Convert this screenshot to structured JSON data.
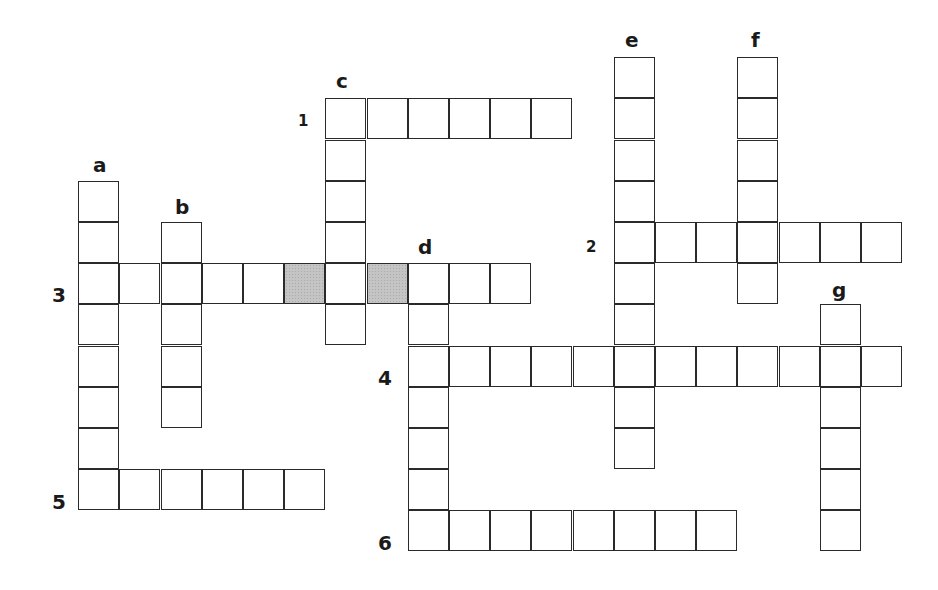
{
  "puzzle": {
    "type": "crossword",
    "cell_size": 41.2,
    "origin_x": 79,
    "origin_y": 58,
    "shade_color": "#c4c4c4",
    "across": [
      {
        "label": "1",
        "row": 1,
        "col": 6,
        "length": 6
      },
      {
        "label": "2",
        "row": 4,
        "col": 13,
        "length": 7
      },
      {
        "label": "3",
        "row": 5,
        "col": 0,
        "length": 11
      },
      {
        "label": "4",
        "row": 7,
        "col": 8,
        "length": 12
      },
      {
        "label": "5",
        "row": 10,
        "col": 0,
        "length": 6
      },
      {
        "label": "6",
        "row": 11,
        "col": 8,
        "length": 8
      }
    ],
    "down": [
      {
        "label": "a",
        "row": 3,
        "col": 0,
        "length": 8
      },
      {
        "label": "b",
        "row": 4,
        "col": 2,
        "length": 5
      },
      {
        "label": "c",
        "row": 1,
        "col": 6,
        "length": 6
      },
      {
        "label": "d",
        "row": 5,
        "col": 8,
        "length": 7
      },
      {
        "label": "e",
        "row": 0,
        "col": 13,
        "length": 10
      },
      {
        "label": "f",
        "row": 0,
        "col": 16,
        "length": 6
      },
      {
        "label": "g",
        "row": 6,
        "col": 18,
        "length": 6
      }
    ],
    "shaded_cells": [
      {
        "row": 5,
        "col": 5
      },
      {
        "row": 5,
        "col": 7
      }
    ],
    "labels": [
      {
        "text": "1",
        "x": 298,
        "y": 114,
        "small": true
      },
      {
        "text": "2",
        "x": 586,
        "y": 240,
        "small": true
      },
      {
        "text": "3",
        "x": 52,
        "y": 285
      },
      {
        "text": "4",
        "x": 378,
        "y": 368
      },
      {
        "text": "5",
        "x": 52,
        "y": 492
      },
      {
        "text": "6",
        "x": 378,
        "y": 533
      },
      {
        "text": "a",
        "x": 93,
        "y": 155,
        "letter": true
      },
      {
        "text": "b",
        "x": 175,
        "y": 197,
        "letter": true
      },
      {
        "text": "c",
        "x": 336,
        "y": 71,
        "letter": true
      },
      {
        "text": "d",
        "x": 418,
        "y": 237,
        "letter": true
      },
      {
        "text": "e",
        "x": 625,
        "y": 30,
        "letter": true
      },
      {
        "text": "f",
        "x": 751,
        "y": 30,
        "letter": true
      },
      {
        "text": "g",
        "x": 832,
        "y": 280,
        "letter": true
      }
    ]
  }
}
